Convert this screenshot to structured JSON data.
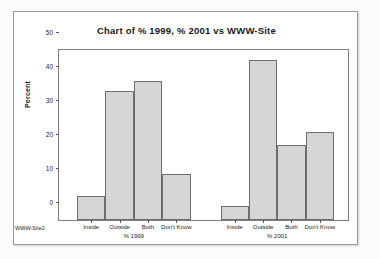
{
  "chart_data": {
    "type": "bar",
    "title": "Chart of % 1999, % 2001 vs WWW-Site",
    "xlabel": "",
    "ylabel": "Percent",
    "ylim": [
      0,
      50
    ],
    "yticks": [
      0,
      10,
      20,
      30,
      40,
      50
    ],
    "grid": false,
    "legend": "none",
    "corner_label": "WWW-Site2",
    "categories": [
      "Inside",
      "Outside",
      "Both",
      "Don't Know"
    ],
    "groups": [
      {
        "name": "% 1999",
        "values": [
          7,
          38,
          41,
          13.5
        ]
      },
      {
        "name": "% 2001",
        "values": [
          4,
          47,
          22,
          26
        ]
      }
    ],
    "series": [
      {
        "name": "% 1999",
        "values": [
          7,
          38,
          41,
          13.5
        ]
      },
      {
        "name": "% 2001",
        "values": [
          4,
          47,
          22,
          26
        ]
      }
    ],
    "colors": {
      "bar_fill": "#d6d6d6",
      "bar_border": "#6f6f6f",
      "plot_background": "#ffffff",
      "axis": "#7d7d7d",
      "text": "#1c1c1c",
      "page_background": "#fcfcfc",
      "frame_border": "#9a9a9a"
    }
  }
}
